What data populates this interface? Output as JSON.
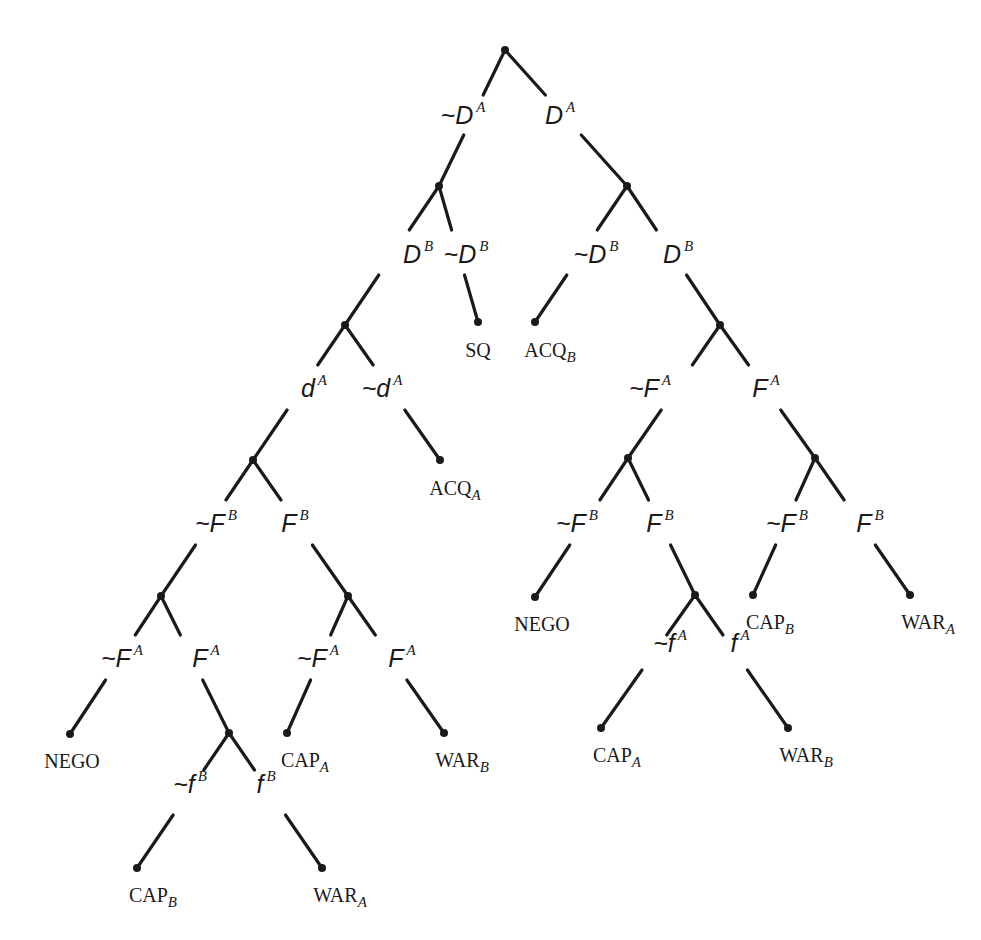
{
  "diagram": {
    "type": "game-tree",
    "nodes": [
      {
        "id": "root",
        "x": 505,
        "y": 50
      },
      {
        "id": "n1",
        "x": 439,
        "y": 186
      },
      {
        "id": "n2",
        "x": 627,
        "y": 186
      },
      {
        "id": "n3",
        "x": 345,
        "y": 325
      },
      {
        "id": "n4",
        "x": 720,
        "y": 325
      },
      {
        "id": "n5",
        "x": 253,
        "y": 460
      },
      {
        "id": "n6",
        "x": 628,
        "y": 458
      },
      {
        "id": "n7",
        "x": 815,
        "y": 458
      },
      {
        "id": "n8",
        "x": 161,
        "y": 596
      },
      {
        "id": "n9",
        "x": 348,
        "y": 596
      },
      {
        "id": "n10",
        "x": 695,
        "y": 595
      },
      {
        "id": "n11",
        "x": 229,
        "y": 733
      },
      {
        "id": "leaf_sq",
        "x": 478,
        "y": 322
      },
      {
        "id": "leaf_acqb",
        "x": 535,
        "y": 322
      },
      {
        "id": "leaf_acqa",
        "x": 440,
        "y": 460
      },
      {
        "id": "leaf_nego_r",
        "x": 535,
        "y": 597
      },
      {
        "id": "leaf_capb_r",
        "x": 753,
        "y": 595
      },
      {
        "id": "leaf_wara_r",
        "x": 910,
        "y": 595
      },
      {
        "id": "leaf_nego_l",
        "x": 70,
        "y": 734
      },
      {
        "id": "leaf_capa_m",
        "x": 287,
        "y": 733
      },
      {
        "id": "leaf_warb_m",
        "x": 444,
        "y": 733
      },
      {
        "id": "leaf_capa_r",
        "x": 601,
        "y": 728
      },
      {
        "id": "leaf_warb_r",
        "x": 788,
        "y": 728
      },
      {
        "id": "leaf_capb_l",
        "x": 137,
        "y": 868
      },
      {
        "id": "leaf_wara_l",
        "x": 322,
        "y": 868
      }
    ],
    "edges": [
      {
        "from": "root",
        "to": "n1",
        "gap": [
          95,
          135
        ]
      },
      {
        "from": "root",
        "to": "n2",
        "gap": [
          95,
          135
        ]
      },
      {
        "from": "n1",
        "to": "n3",
        "gap": [
          230,
          275
        ]
      },
      {
        "from": "n1",
        "to": "leaf_sq",
        "gap": [
          230,
          275
        ]
      },
      {
        "from": "n2",
        "to": "leaf_acqb",
        "gap": [
          230,
          275
        ]
      },
      {
        "from": "n2",
        "to": "n4",
        "gap": [
          230,
          275
        ]
      },
      {
        "from": "n3",
        "to": "n5",
        "gap": [
          365,
          410
        ]
      },
      {
        "from": "n3",
        "to": "leaf_acqa",
        "gap": [
          365,
          410
        ]
      },
      {
        "from": "n4",
        "to": "n6",
        "gap": [
          365,
          410
        ]
      },
      {
        "from": "n4",
        "to": "n7",
        "gap": [
          365,
          410
        ]
      },
      {
        "from": "n5",
        "to": "n8",
        "gap": [
          500,
          545
        ]
      },
      {
        "from": "n5",
        "to": "n9",
        "gap": [
          500,
          545
        ]
      },
      {
        "from": "n6",
        "to": "leaf_nego_r",
        "gap": [
          500,
          545
        ]
      },
      {
        "from": "n6",
        "to": "n10",
        "gap": [
          500,
          545
        ]
      },
      {
        "from": "n7",
        "to": "leaf_capb_r",
        "gap": [
          500,
          545
        ]
      },
      {
        "from": "n7",
        "to": "leaf_wara_r",
        "gap": [
          500,
          545
        ]
      },
      {
        "from": "n8",
        "to": "leaf_nego_l",
        "gap": [
          635,
          680
        ]
      },
      {
        "from": "n8",
        "to": "n11",
        "gap": [
          635,
          680
        ]
      },
      {
        "from": "n9",
        "to": "leaf_capa_m",
        "gap": [
          635,
          680
        ]
      },
      {
        "from": "n9",
        "to": "leaf_warb_m",
        "gap": [
          635,
          680
        ]
      },
      {
        "from": "n10",
        "to": "leaf_capa_r",
        "gap": [
          635,
          670
        ]
      },
      {
        "from": "n10",
        "to": "leaf_warb_r",
        "gap": [
          635,
          670
        ]
      },
      {
        "from": "n11",
        "to": "leaf_capb_l",
        "gap": [
          770,
          815
        ]
      },
      {
        "from": "n11",
        "to": "leaf_wara_l",
        "gap": [
          770,
          815
        ]
      }
    ],
    "move_labels": [
      {
        "id": "m1",
        "x": 463,
        "y": 114,
        "neg": true,
        "sym": "D",
        "sup": "A"
      },
      {
        "id": "m2",
        "x": 560,
        "y": 114,
        "neg": false,
        "sym": "D",
        "sup": "A"
      },
      {
        "id": "m3",
        "x": 418,
        "y": 253,
        "neg": false,
        "sym": "D",
        "sup": "B"
      },
      {
        "id": "m4",
        "x": 466,
        "y": 253,
        "neg": true,
        "sym": "D",
        "sup": "B"
      },
      {
        "id": "m5",
        "x": 596,
        "y": 253,
        "neg": true,
        "sym": "D",
        "sup": "B"
      },
      {
        "id": "m6",
        "x": 678,
        "y": 253,
        "neg": false,
        "sym": "D",
        "sup": "B"
      },
      {
        "id": "m7",
        "x": 314,
        "y": 387,
        "neg": false,
        "sym": "d",
        "sup": "A"
      },
      {
        "id": "m8",
        "x": 382,
        "y": 387,
        "neg": true,
        "sym": "d",
        "sup": "A"
      },
      {
        "id": "m9",
        "x": 650,
        "y": 387,
        "neg": true,
        "sym": "F",
        "sup": "A"
      },
      {
        "id": "m10",
        "x": 766,
        "y": 387,
        "neg": false,
        "sym": "F",
        "sup": "A"
      },
      {
        "id": "m11",
        "x": 216,
        "y": 522,
        "neg": true,
        "sym": "F",
        "sup": "B"
      },
      {
        "id": "m12",
        "x": 295,
        "y": 522,
        "neg": false,
        "sym": "F",
        "sup": "B"
      },
      {
        "id": "m13",
        "x": 577,
        "y": 522,
        "neg": true,
        "sym": "F",
        "sup": "B"
      },
      {
        "id": "m14",
        "x": 660,
        "y": 522,
        "neg": false,
        "sym": "F",
        "sup": "B"
      },
      {
        "id": "m15",
        "x": 787,
        "y": 522,
        "neg": true,
        "sym": "F",
        "sup": "B"
      },
      {
        "id": "m16",
        "x": 870,
        "y": 522,
        "neg": false,
        "sym": "F",
        "sup": "B"
      },
      {
        "id": "m17",
        "x": 122,
        "y": 657,
        "neg": true,
        "sym": "F",
        "sup": "A"
      },
      {
        "id": "m18",
        "x": 206,
        "y": 657,
        "neg": false,
        "sym": "F",
        "sup": "A"
      },
      {
        "id": "m19",
        "x": 318,
        "y": 657,
        "neg": true,
        "sym": "F",
        "sup": "A"
      },
      {
        "id": "m20",
        "x": 402,
        "y": 657,
        "neg": false,
        "sym": "F",
        "sup": "A"
      },
      {
        "id": "m21",
        "x": 670,
        "y": 642,
        "neg": true,
        "sym": "f",
        "sup": "A"
      },
      {
        "id": "m22",
        "x": 740,
        "y": 642,
        "neg": false,
        "sym": "f",
        "sup": "A"
      },
      {
        "id": "m23",
        "x": 190,
        "y": 783,
        "neg": true,
        "sym": "f",
        "sup": "B"
      },
      {
        "id": "m24",
        "x": 266,
        "y": 783,
        "neg": false,
        "sym": "f",
        "sup": "B"
      }
    ],
    "outcome_labels": [
      {
        "id": "o_sq",
        "x": 478,
        "y": 340,
        "text": "SQ",
        "sub": ""
      },
      {
        "id": "o_acqb",
        "x": 550,
        "y": 340,
        "text": "ACQ",
        "sub": "B"
      },
      {
        "id": "o_acqa",
        "x": 455,
        "y": 478,
        "text": "ACQ",
        "sub": "A"
      },
      {
        "id": "o_nego_r",
        "x": 542,
        "y": 614,
        "text": "NEGO",
        "sub": ""
      },
      {
        "id": "o_capb_r",
        "x": 770,
        "y": 612,
        "text": "CAP",
        "sub": "B"
      },
      {
        "id": "o_wara_r",
        "x": 928,
        "y": 612,
        "text": "WAR",
        "sub": "A"
      },
      {
        "id": "o_nego_l",
        "x": 72,
        "y": 751,
        "text": "NEGO",
        "sub": ""
      },
      {
        "id": "o_capa_m",
        "x": 305,
        "y": 750,
        "text": "CAP",
        "sub": "A"
      },
      {
        "id": "o_warb_m",
        "x": 462,
        "y": 750,
        "text": "WAR",
        "sub": "B"
      },
      {
        "id": "o_capa_r",
        "x": 617,
        "y": 745,
        "text": "CAP",
        "sub": "A"
      },
      {
        "id": "o_warb_r",
        "x": 806,
        "y": 745,
        "text": "WAR",
        "sub": "B"
      },
      {
        "id": "o_capb_l",
        "x": 153,
        "y": 885,
        "text": "CAP",
        "sub": "B"
      },
      {
        "id": "o_wara_l",
        "x": 340,
        "y": 885,
        "text": "WAR",
        "sub": "A"
      }
    ],
    "negation_symbol": "~"
  }
}
